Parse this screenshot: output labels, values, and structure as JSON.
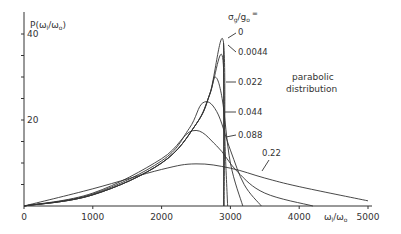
{
  "chart_data": {
    "type": "line",
    "title": "",
    "ylabel": "P(ω_l/ω_o)",
    "xlabel": "ω_l/ω_o",
    "xlim": [
      0,
      5000
    ],
    "ylim": [
      0,
      40
    ],
    "x_ticks": [
      "0",
      "1000",
      "2000",
      "3000",
      "4000",
      "5000"
    ],
    "y_ticks": [
      "20",
      "40"
    ],
    "legend_title": "σ_g/g_o =",
    "annotation": "parabolic distribution",
    "grid": false,
    "series": [
      {
        "name": "0",
        "label": "0",
        "points": [
          [
            0,
            0
          ],
          [
            1000,
            2.6
          ],
          [
            2000,
            10
          ],
          [
            2500,
            19
          ],
          [
            2700,
            26
          ],
          [
            2900,
            38
          ],
          [
            2910,
            0
          ]
        ]
      },
      {
        "name": "0.0044",
        "label": "0.0044",
        "points": [
          [
            0,
            0
          ],
          [
            1000,
            2.6
          ],
          [
            2000,
            10
          ],
          [
            2500,
            19
          ],
          [
            2700,
            26
          ],
          [
            2880,
            35
          ],
          [
            2920,
            15
          ],
          [
            2960,
            0
          ]
        ]
      },
      {
        "name": "0.022",
        "label": "0.022",
        "points": [
          [
            0,
            0
          ],
          [
            1000,
            2.6
          ],
          [
            2000,
            10
          ],
          [
            2500,
            19
          ],
          [
            2700,
            26
          ],
          [
            2780,
            30
          ],
          [
            2880,
            25
          ],
          [
            3000,
            10
          ],
          [
            3180,
            0
          ]
        ]
      },
      {
        "name": "0.044",
        "label": "0.044",
        "points": [
          [
            0,
            0
          ],
          [
            1000,
            2.8
          ],
          [
            2000,
            10.5
          ],
          [
            2400,
            18
          ],
          [
            2600,
            24
          ],
          [
            2800,
            22
          ],
          [
            3000,
            13
          ],
          [
            3200,
            5
          ],
          [
            3450,
            0
          ]
        ]
      },
      {
        "name": "0.088",
        "label": "0.088",
        "points": [
          [
            0,
            0
          ],
          [
            1000,
            3
          ],
          [
            2000,
            11
          ],
          [
            2450,
            17.5
          ],
          [
            2800,
            14
          ],
          [
            3100,
            8
          ],
          [
            3500,
            3
          ],
          [
            4200,
            0
          ]
        ]
      },
      {
        "name": "0.22",
        "label": "0.22",
        "points": [
          [
            0,
            0
          ],
          [
            1000,
            4
          ],
          [
            2000,
            8.5
          ],
          [
            2500,
            9.8
          ],
          [
            3000,
            8.8
          ],
          [
            3500,
            6.5
          ],
          [
            4000,
            4.5
          ],
          [
            5000,
            1.2
          ]
        ]
      }
    ]
  },
  "labels": {
    "y_axis": "P(ω",
    "y_axis_sub": "l",
    "y_axis_rest": "/ω",
    "y_axis_sub2": "o",
    "y_axis_close": ")",
    "legend_sigma": "σ",
    "legend_g": "g",
    "legend_slash": "/g",
    "legend_o": "o",
    "legend_eq": "=",
    "x_axis": "ω",
    "x_axis_sub": "l",
    "x_axis_rest": "/ω",
    "x_axis_sub2": "o",
    "annotation_line1": "parabolic",
    "annotation_line2": "distribution"
  }
}
